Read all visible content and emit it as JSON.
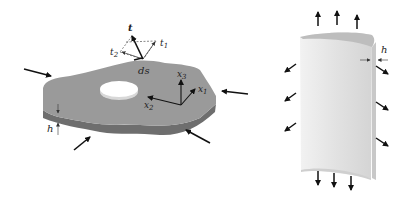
{
  "figure": {
    "left_panel": {
      "name": "flat plate with hole under in-plane loads",
      "labels": {
        "traction": "t",
        "traction_component_1": "t",
        "traction_component_1_sub": "1",
        "traction_component_2": "t",
        "traction_component_2_sub": "2",
        "arc_element": "ds",
        "axis_x1": "x",
        "axis_x1_sub": "1",
        "axis_x2": "x",
        "axis_x2_sub": "2",
        "axis_x3": "x",
        "axis_x3_sub": "3",
        "thickness": "h"
      },
      "load_arrow_count": 4
    },
    "right_panel": {
      "name": "curved shell panel under loads",
      "labels": {
        "thickness": "h"
      },
      "top_arrow_count": 3,
      "bottom_arrow_count": 3,
      "left_arrow_count": 3,
      "right_arrow_count": 3
    },
    "colors": {
      "plate_top": "#9a9a9a",
      "plate_side": "#6e6e6e",
      "shell_face": "#e4e4e4",
      "shell_edge": "#bdbdbd",
      "arrow": "#111111"
    }
  }
}
